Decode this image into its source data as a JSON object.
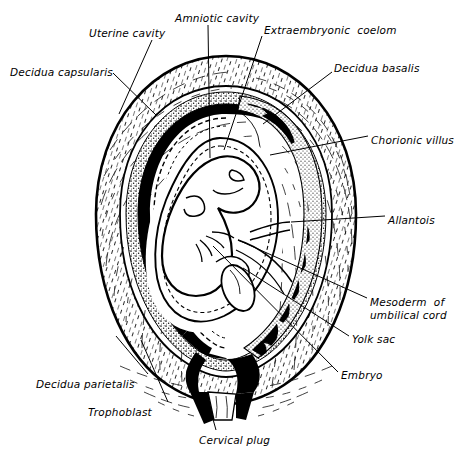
{
  "figure": {
    "type": "anatomical-line-drawing",
    "style": "black-and-white engraved line art",
    "colors": {
      "ink": "#000000",
      "paper": "#ffffff",
      "stipple": "#4a4a4a"
    }
  },
  "labels": [
    {
      "id": "amniotic-cavity",
      "text": "Amniotic cavity",
      "x": 175,
      "y": 12,
      "align": "left"
    },
    {
      "id": "uterine-cavity",
      "text": "Uterine cavity",
      "x": 89,
      "y": 27,
      "align": "left"
    },
    {
      "id": "extraembryonic-coelom",
      "text": "Extraembryonic  coelom",
      "x": 264,
      "y": 24,
      "align": "left"
    },
    {
      "id": "decidua-capsularis",
      "text": "Decidua capsularis",
      "x": 10,
      "y": 66,
      "align": "left"
    },
    {
      "id": "decidua-basalis",
      "text": "Decidua basalis",
      "x": 334,
      "y": 62,
      "align": "left"
    },
    {
      "id": "chorionic-villus",
      "text": "Chorionic villus",
      "x": 371,
      "y": 134,
      "align": "left"
    },
    {
      "id": "allantois",
      "text": "Allantois",
      "x": 388,
      "y": 214,
      "align": "left"
    },
    {
      "id": "mesoderm-umbilical-cord",
      "text": "Mesoderm  of\numbilical cord",
      "x": 370,
      "y": 296,
      "align": "left"
    },
    {
      "id": "yolk-sac",
      "text": "Yolk sac",
      "x": 352,
      "y": 333,
      "align": "left"
    },
    {
      "id": "embryo",
      "text": "Embryo",
      "x": 341,
      "y": 369,
      "align": "left"
    },
    {
      "id": "decidua-parietalis",
      "text": "Decidua parietalis",
      "x": 36,
      "y": 378,
      "align": "left"
    },
    {
      "id": "trophoblast",
      "text": "Trophoblast",
      "x": 88,
      "y": 406,
      "align": "left"
    },
    {
      "id": "cervical-plug",
      "text": "Cervical plug",
      "x": 199,
      "y": 434,
      "align": "left"
    }
  ],
  "leader_lines": [
    {
      "id": "leader-amniotic-cavity",
      "points": "208,25 210,158"
    },
    {
      "id": "leader-uterine-cavity",
      "points": "152,40 119,114"
    },
    {
      "id": "leader-extraembryonic-coelom",
      "points": "262,36 224,150"
    },
    {
      "id": "leader-decidua-capsularis",
      "points": "113,73 156,115"
    },
    {
      "id": "leader-decidua-basalis",
      "points": "332,72 263,124"
    },
    {
      "id": "leader-chorionic-villus",
      "points": "368,136 270,155"
    },
    {
      "id": "leader-allantois",
      "points": "385,216 291,222"
    },
    {
      "id": "leader-mesoderm",
      "points": "367,298 238,240"
    },
    {
      "id": "leader-yolk-sac",
      "points": "349,336 243,268"
    },
    {
      "id": "leader-embryo",
      "points": "338,372 213,246"
    },
    {
      "id": "leader-decidua-parietalis",
      "points": "148,374 116,336"
    },
    {
      "id": "leader-trophoblast",
      "points": "168,402 141,340"
    },
    {
      "id": "leader-cervical-plug",
      "points": "216,430 206,394"
    }
  ],
  "structures": [
    {
      "id": "uterine-wall",
      "description": "outer myometrium oval with fine hatch texture"
    },
    {
      "id": "decidua-layer",
      "description": "stippled decidual band inside the wall"
    },
    {
      "id": "uterine-cavity-space",
      "description": "solid black crescent cavity"
    },
    {
      "id": "chorionic-villi",
      "description": "branched black villi projecting into decidua basalis"
    },
    {
      "id": "amnion",
      "description": "dashed oval enclosing the embryo"
    },
    {
      "id": "embryo-body",
      "description": "curled C-shaped embryo with limb buds"
    },
    {
      "id": "yolk-sac-body",
      "description": "small oval vesicle beside the embryo"
    },
    {
      "id": "cervical-canal",
      "description": "black funnel at the base"
    },
    {
      "id": "cervical-plug-body",
      "description": "white plug within the cervical canal"
    }
  ]
}
